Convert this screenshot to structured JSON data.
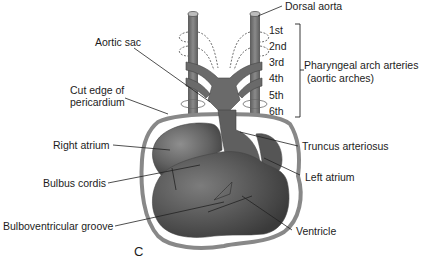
{
  "figure": {
    "panel_letter": "C",
    "labels": {
      "dorsal_aorta": "Dorsal aorta",
      "aortic_sac": "Aortic sac",
      "cut_edge_line1": "Cut edge of",
      "cut_edge_line2": "pericardium",
      "right_atrium": "Right atrium",
      "bulbus_cordis": "Bulbus cordis",
      "bulboventricular_groove": "Bulboventricular groove",
      "truncus_arteriosus": "Truncus arteriosus",
      "left_atrium": "Left atrium",
      "ventricle": "Ventricle",
      "pharyngeal_line1": "Pharyngeal arch arteries",
      "pharyngeal_line2": "(aortic arches)"
    },
    "arches": [
      "1st",
      "2nd",
      "3rd",
      "4th",
      "5th",
      "6th"
    ],
    "colors": {
      "heart_dark": "#4a4a4a",
      "heart_mid": "#6e6e6e",
      "heart_light": "#8c8c8c",
      "pericardium": "#8a8a8a",
      "vessel": "#7a7a7a",
      "leader_line": "#222222"
    }
  }
}
